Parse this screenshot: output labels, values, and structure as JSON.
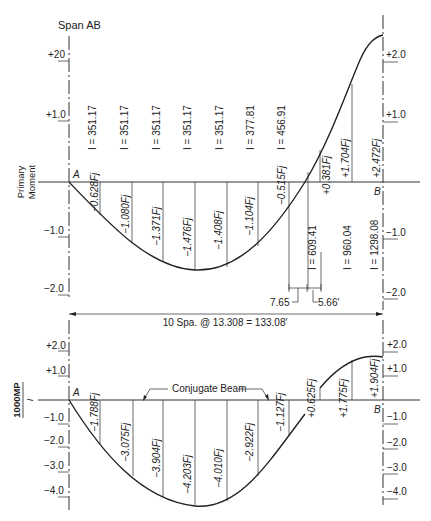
{
  "title": "Span AB",
  "top_diagram": {
    "ylabel_line1": "Primary",
    "ylabel_line2": "Moment",
    "left_ticks": [
      "+20",
      "+1.0",
      "−1.0",
      "−2.0"
    ],
    "right_ticks": [
      "+2.0",
      "+1.0",
      "−1.0",
      "−2.0"
    ],
    "point_a": "A",
    "point_b": "B",
    "inertias": [
      "I = 351.17",
      "I = 351.17",
      "I = 351.17",
      "I = 351.17",
      "I = 351.17",
      "I = 377.81",
      "I = 456.91",
      "I = 609.41",
      "I = 960.04",
      "I = 1298.08"
    ],
    "ordinates": [
      "−0.628Fj",
      "−1.080Fj",
      "−1.371Fj",
      "−1.476Fj",
      "−1.408Fj",
      "−1.104Fj",
      "−0.515Fj",
      "+0.381Fj",
      "+1.704Fj",
      "+2.472Fj"
    ],
    "dim_left": "7.65",
    "dim_right": "5.66′"
  },
  "span_dimension": "10 Spa. @ 13.308 = 133.08′",
  "bottom_diagram": {
    "ylabel_num": "1000MP",
    "ylabel_den": "I",
    "left_ticks": [
      "+2.0",
      "+1.0",
      "−1.0",
      "−2.0",
      "−3.0",
      "−4.0"
    ],
    "right_ticks": [
      "+2.0",
      "+1.0",
      "−1.0",
      "−2.0",
      "−3.0",
      "−4.0"
    ],
    "point_a": "A",
    "point_b": "B",
    "annotation": "Conjugate Beam",
    "ordinates": [
      "−1.788Fj",
      "−3.075Fj",
      "−3.904Fj",
      "−4.203Fj",
      "−4.010Fj",
      "−2.922Fj",
      "−1.127Fj",
      "+0.625Fj",
      "+1.775Fj",
      "+1.904Fj"
    ]
  }
}
